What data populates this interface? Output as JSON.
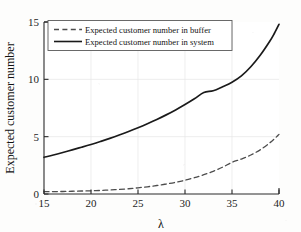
{
  "chart_data": {
    "type": "line",
    "title": "",
    "subtitle": "",
    "xlabel": "λ",
    "ylabel": "Expected customer number",
    "xlim": [
      15,
      40
    ],
    "ylim": [
      0,
      15
    ],
    "xticks": [
      15,
      20,
      25,
      30,
      35,
      40
    ],
    "yticks": [
      0,
      5,
      10,
      15
    ],
    "xtick_labels": [
      "15",
      "20",
      "25",
      "30",
      "35",
      "40"
    ],
    "ytick_labels": [
      "0",
      "5",
      "10",
      "15"
    ],
    "grid": true,
    "legend_position": "upper left",
    "x": [
      15,
      16,
      17,
      18,
      19,
      20,
      21,
      22,
      23,
      24,
      25,
      26,
      27,
      28,
      29,
      30,
      31,
      32,
      33,
      34,
      35,
      36,
      37,
      38,
      39,
      39.5,
      40
    ],
    "series": [
      {
        "name": "Expected customer number in buffer",
        "style": "dashed",
        "color": "#4d4d4d",
        "values": [
          0.2,
          0.21,
          0.22,
          0.24,
          0.26,
          0.28,
          0.31,
          0.35,
          0.4,
          0.46,
          0.54,
          0.63,
          0.74,
          0.87,
          1.02,
          1.2,
          1.42,
          1.68,
          1.98,
          2.34,
          2.76,
          3.05,
          3.4,
          3.85,
          4.45,
          4.8,
          5.2
        ]
      },
      {
        "name": "Expected customer number in system",
        "style": "solid",
        "color": "#1a1a1a",
        "values": [
          3.2,
          3.4,
          3.62,
          3.85,
          4.08,
          4.32,
          4.58,
          4.85,
          5.14,
          5.45,
          5.78,
          6.13,
          6.5,
          6.9,
          7.33,
          7.8,
          8.3,
          8.85,
          9.0,
          9.35,
          9.75,
          10.3,
          11.1,
          12.1,
          13.3,
          14.0,
          14.8
        ]
      }
    ],
    "annotations": []
  },
  "legend": {
    "items": [
      {
        "label": "Expected customer number in buffer",
        "style": "dashed"
      },
      {
        "label": "Expected customer number in system",
        "style": "solid"
      }
    ]
  },
  "axes": {
    "x_title": "λ",
    "y_title": "Expected customer number"
  }
}
